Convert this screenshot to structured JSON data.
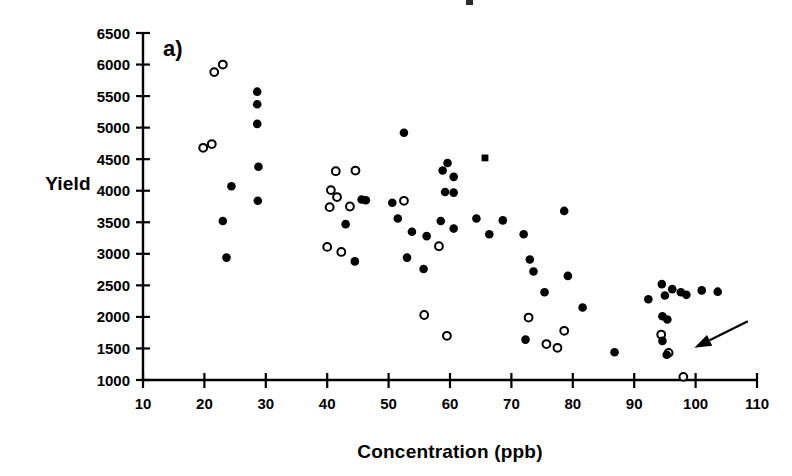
{
  "figure": {
    "panel_label": "a)",
    "top_artifact": "cropped-title-remnant"
  },
  "chart_data": {
    "type": "scatter",
    "title": "",
    "subtitle": "",
    "xlabel": "Concentration (ppb)",
    "ylabel": "Yield",
    "xlim": [
      10,
      110
    ],
    "ylim": [
      1000,
      6500
    ],
    "xticks": [
      10,
      20,
      30,
      40,
      50,
      60,
      70,
      80,
      90,
      100,
      110
    ],
    "yticks": [
      1000,
      1500,
      2000,
      2500,
      3000,
      3500,
      4000,
      4500,
      5000,
      5500,
      6000,
      6500
    ],
    "xtick_labels": [
      "10",
      "20",
      "30",
      "40",
      "50",
      "60",
      "70",
      "80",
      "90",
      "100",
      "110"
    ],
    "ytick_labels": [
      "1000",
      "1500",
      "2000",
      "2500",
      "3000",
      "3500",
      "4000",
      "4500",
      "5000",
      "5500",
      "6000",
      "6500"
    ],
    "grid": false,
    "legend": "none",
    "series": [
      {
        "name": "open-circle-series",
        "marker": "open-circle",
        "color": "#000000",
        "points": [
          [
            21.6,
            5880
          ],
          [
            23.0,
            6000
          ],
          [
            19.8,
            4680
          ],
          [
            21.2,
            4740
          ],
          [
            41.4,
            4310
          ],
          [
            44.6,
            4320
          ],
          [
            40.6,
            4010
          ],
          [
            41.6,
            3900
          ],
          [
            40.4,
            3740
          ],
          [
            43.7,
            3750
          ],
          [
            40.0,
            3110
          ],
          [
            42.3,
            3030
          ],
          [
            52.5,
            3840
          ],
          [
            58.2,
            3120
          ],
          [
            55.8,
            2030
          ],
          [
            59.5,
            1700
          ],
          [
            72.8,
            1990
          ],
          [
            75.7,
            1570
          ],
          [
            77.5,
            1510
          ],
          [
            78.6,
            1780
          ],
          [
            94.4,
            1720
          ],
          [
            95.6,
            1430
          ],
          [
            98.0,
            1050
          ]
        ]
      },
      {
        "name": "filled-circle-series",
        "marker": "filled-circle",
        "color": "#000000",
        "points": [
          [
            28.6,
            5570
          ],
          [
            28.6,
            5370
          ],
          [
            28.6,
            5060
          ],
          [
            24.4,
            4070
          ],
          [
            28.8,
            4380
          ],
          [
            23.0,
            3520
          ],
          [
            28.7,
            3840
          ],
          [
            23.6,
            2940
          ],
          [
            45.6,
            3860
          ],
          [
            46.3,
            3850
          ],
          [
            43.0,
            3470
          ],
          [
            44.5,
            2880
          ],
          [
            52.5,
            4920
          ],
          [
            50.6,
            3810
          ],
          [
            51.5,
            3560
          ],
          [
            53.8,
            3350
          ],
          [
            56.2,
            3280
          ],
          [
            53.0,
            2940
          ],
          [
            55.7,
            2760
          ],
          [
            58.8,
            4320
          ],
          [
            59.6,
            4440
          ],
          [
            60.6,
            4220
          ],
          [
            59.2,
            3980
          ],
          [
            60.6,
            3970
          ],
          [
            58.5,
            3520
          ],
          [
            60.6,
            3400
          ],
          [
            64.3,
            3560
          ],
          [
            68.6,
            3530
          ],
          [
            66.4,
            3310
          ],
          [
            72.0,
            3310
          ],
          [
            73.0,
            2910
          ],
          [
            73.6,
            2720
          ],
          [
            72.3,
            1640
          ],
          [
            75.4,
            2390
          ],
          [
            78.6,
            3680
          ],
          [
            79.2,
            2650
          ],
          [
            81.6,
            2150
          ],
          [
            86.8,
            1440
          ],
          [
            92.3,
            2280
          ],
          [
            94.5,
            2520
          ],
          [
            95.0,
            2340
          ],
          [
            96.2,
            2440
          ],
          [
            98.5,
            2350
          ],
          [
            97.6,
            2390
          ],
          [
            101.0,
            2420
          ],
          [
            103.6,
            2400
          ],
          [
            94.6,
            2010
          ],
          [
            95.4,
            1960
          ],
          [
            94.6,
            1620
          ],
          [
            95.3,
            1400
          ]
        ]
      },
      {
        "name": "square-marker-series",
        "marker": "filled-square",
        "color": "#000000",
        "points": [
          [
            65.7,
            4520
          ]
        ]
      }
    ],
    "annotations": [
      {
        "name": "pointer-arrow",
        "type": "arrow",
        "from": [
          108.5,
          1930
        ],
        "to": [
          99.8,
          1510
        ]
      }
    ]
  }
}
